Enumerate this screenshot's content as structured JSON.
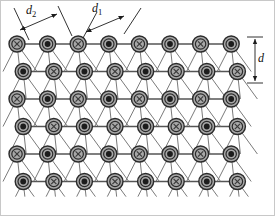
{
  "figure": {
    "name": "crystal-lattice-dislocation-diagram",
    "width": 275,
    "height": 216,
    "background": "#ffffff",
    "border_color": "#c8c8c8"
  },
  "labels": [
    {
      "id": "d2",
      "text": "d",
      "sub": "2",
      "x": 26,
      "y": 14,
      "kind": "spacing-label"
    },
    {
      "id": "d1",
      "text": "d",
      "sub": "1",
      "x": 92,
      "y": 12,
      "kind": "spacing-label"
    },
    {
      "id": "d",
      "text": "d",
      "sub": "",
      "x": 258,
      "y": 62,
      "kind": "spacing-label"
    }
  ],
  "atoms": {
    "symbols": {
      "cross": "x",
      "dot": "dot"
    },
    "ring_fill": "#a8a8a8",
    "ring_stroke": "#2b2b2b",
    "dot_fill": "#1c1c1c",
    "cross_color": "#3a3a3a",
    "radius": 8.0,
    "inner_radius": 5.2,
    "dot_radius": 2.9,
    "columns": 8,
    "rows": 6,
    "col_spacing": 30.6,
    "row_spacing": 27.5,
    "row_offset": 6.2,
    "origin_x": 17,
    "origin_y": 44,
    "rows_data": [
      {
        "row": 0,
        "shift": 0,
        "types": [
          "cross",
          "dot",
          "cross",
          "dot",
          "cross",
          "dot",
          "cross",
          "dot"
        ]
      },
      {
        "row": 1,
        "shift": 6.2,
        "types": [
          "dot",
          "cross",
          "dot",
          "cross",
          "dot",
          "cross",
          "dot",
          "cross"
        ]
      },
      {
        "row": 2,
        "shift": 0,
        "types": [
          "cross",
          "dot",
          "cross",
          "dot",
          "cross",
          "dot",
          "cross",
          "dot"
        ]
      },
      {
        "row": 3,
        "shift": 6.2,
        "types": [
          "dot",
          "cross",
          "dot",
          "cross",
          "dot",
          "cross",
          "dot",
          "cross"
        ]
      },
      {
        "row": 4,
        "shift": 0,
        "types": [
          "cross",
          "dot",
          "cross",
          "dot",
          "cross",
          "dot",
          "cross",
          "dot"
        ]
      },
      {
        "row": 5,
        "shift": 6.2,
        "types": [
          "dot",
          "cross",
          "dot",
          "cross",
          "dot",
          "cross",
          "dot",
          "cross"
        ]
      }
    ]
  },
  "bonds": {
    "horizontal_color": "#555555",
    "diagonal_color": "#6b6b6b",
    "horizontal_width": 1.3,
    "diagonal_width": 0.9,
    "diagonal_families": [
      {
        "name": "steep-left",
        "dx": -14
      },
      {
        "name": "steep-mid",
        "dx": 3
      },
      {
        "name": "steep-right",
        "dx": 20
      }
    ]
  },
  "dimension_marks": {
    "d2": {
      "line_a": [
        14,
        8,
        29,
        40
      ],
      "line_b": [
        58,
        6,
        72,
        36
      ],
      "arrow": [
        20,
        30,
        57,
        14
      ]
    },
    "d1": {
      "line_a": [
        83,
        38,
        97,
        12
      ],
      "line_b": [
        124,
        34,
        141,
        8
      ],
      "arrow": [
        86,
        32,
        124,
        16
      ]
    },
    "d": {
      "cap_top": [
        247,
        37,
        263,
        37
      ],
      "cap_bottom": [
        247,
        83,
        263,
        83
      ],
      "arrow": [
        255,
        39,
        255,
        81
      ]
    }
  }
}
